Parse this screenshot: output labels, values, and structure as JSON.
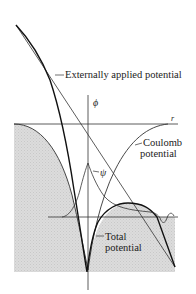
{
  "figure": {
    "labels": {
      "external": "Externally applied potential",
      "phi": "ϕ",
      "r": "r",
      "coulomb_line1": "Coulomb",
      "coulomb_line2": "potential",
      "psi": "ψ",
      "total_line1": "Total",
      "total_line2": "potential"
    },
    "colors": {
      "curve": "#1a1a1a",
      "thin_line": "#333333",
      "shade": "#d9d9d9",
      "background": "#ffffff"
    }
  }
}
